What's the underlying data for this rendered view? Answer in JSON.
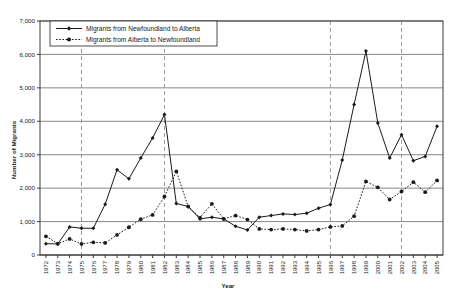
{
  "chart_data": {
    "type": "line",
    "title": "",
    "xlabel": "Year",
    "ylabel": "Number of Migrants",
    "ylim": [
      0,
      7000
    ],
    "ytick_step": 1000,
    "ytick_labels": [
      "0",
      "1,000",
      "2,000",
      "3,000",
      "4,000",
      "5,000",
      "6,000",
      "7,000"
    ],
    "ytick_values": [
      0,
      1000,
      2000,
      3000,
      4000,
      5000,
      6000,
      7000
    ],
    "grid": true,
    "legend_position": "top-left",
    "categories": [
      "1972",
      "1973",
      "1974",
      "1975",
      "1976",
      "1977",
      "1978",
      "1979",
      "1980",
      "1981",
      "1982",
      "1983",
      "1984",
      "1985",
      "1986",
      "1987",
      "1988",
      "1989",
      "1990",
      "1991",
      "1992",
      "1993",
      "1994",
      "1995",
      "1996",
      "1997",
      "1998",
      "1999",
      "2000",
      "2001",
      "2002",
      "2003",
      "2004",
      "2005"
    ],
    "series": [
      {
        "name": "Migrants from Newfoundland to Alberta",
        "style": "solid",
        "marker": "filled-diamond",
        "values": [
          340,
          330,
          840,
          800,
          800,
          1520,
          2550,
          2280,
          2900,
          3500,
          4200,
          1540,
          1450,
          1080,
          1130,
          1080,
          860,
          750,
          1130,
          1180,
          1230,
          1210,
          1250,
          1400,
          1510,
          2840,
          4500,
          6100,
          3950,
          2900,
          3600,
          2820,
          2950,
          3850
        ]
      },
      {
        "name": "Migrants from Alberta to Newfoundland",
        "style": "dotted",
        "marker": "filled-circle",
        "values": [
          560,
          340,
          480,
          330,
          380,
          360,
          600,
          830,
          1070,
          1200,
          1750,
          2500,
          1450,
          1120,
          1530,
          1080,
          1180,
          1060,
          780,
          760,
          780,
          760,
          720,
          760,
          840,
          870,
          1160,
          2200,
          2020,
          1660,
          1900,
          2180,
          1880,
          2230
        ]
      }
    ],
    "vertical_markers": [
      "1975",
      "1982",
      "1996",
      "2002"
    ]
  }
}
